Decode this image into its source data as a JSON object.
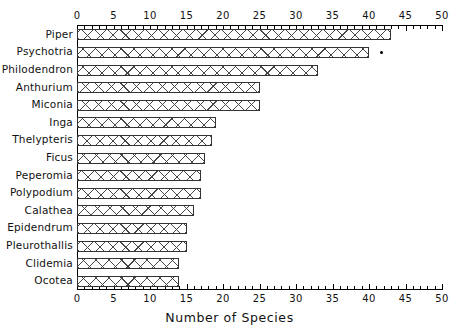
{
  "chart_data": {
    "type": "bar",
    "orientation": "horizontal",
    "title": "",
    "xlabel": "Number of Species",
    "ylabel": "",
    "xlim": [
      0,
      50
    ],
    "xticks": [
      0,
      5,
      10,
      15,
      20,
      25,
      30,
      35,
      40,
      45,
      50
    ],
    "xtick_labels": [
      "0",
      "5",
      "10",
      "15",
      "20",
      "25",
      "30",
      "35",
      "40",
      "45",
      "50"
    ],
    "minor_tick_step": 1,
    "grid": false,
    "legend": null,
    "axis_top_labels": true,
    "axis_bottom_labels": true,
    "bar_fill": "cross-hatch",
    "bar_edge_color": "#333333",
    "bar_face_color": "#ffffff",
    "categories": [
      "Piper",
      "Psychotria",
      "Philodendron",
      "Anthurium",
      "Miconia",
      "Inga",
      "Thelypteris",
      "Ficus",
      "Peperomia",
      "Polypodium",
      "Calathea",
      "Epidendrum",
      "Pleurothallis",
      "Clidemia",
      "Ocotea"
    ],
    "values": [
      43,
      40,
      33,
      25,
      25,
      19,
      18.5,
      17.5,
      17,
      17,
      16,
      15,
      15,
      14,
      14
    ],
    "annotations": [
      {
        "category": "Psychotria",
        "marker": "dot",
        "x": 41.5,
        "note": "point marker to the right of the Psychotria bar"
      }
    ]
  },
  "axis_title": {
    "x": "Number of Species"
  }
}
